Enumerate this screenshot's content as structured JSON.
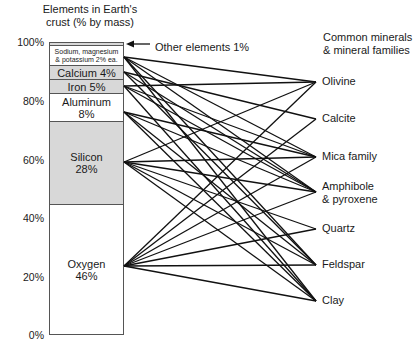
{
  "left_title": {
    "line1": "Elements in Earth's",
    "line2": "crust (% by mass)"
  },
  "right_title": {
    "line1": "Common minerals",
    "line2": "& mineral families"
  },
  "axis_ticks": [
    "100%",
    "80%",
    "60%",
    "40%",
    "20%",
    "0%"
  ],
  "callout": "Other elements 1%",
  "elements": [
    {
      "id": "other",
      "label": "",
      "percent": 1,
      "fill": "#d8d8d8"
    },
    {
      "id": "na_mg_k",
      "label1": "Sodium, magnesium",
      "label2": "& potassium 2% ea.",
      "percent": 6,
      "fill": "#ffffff"
    },
    {
      "id": "calcium",
      "label1": "Calcium 4%",
      "label2": "",
      "percent": 4,
      "fill": "#d8d8d8"
    },
    {
      "id": "iron",
      "label1": "Iron 5%",
      "label2": "",
      "percent": 5,
      "fill": "#d8d8d8"
    },
    {
      "id": "aluminum",
      "label1": "Aluminum",
      "label2": "8%",
      "percent": 8,
      "fill": "#ffffff"
    },
    {
      "id": "silicon",
      "label1": "Silicon",
      "label2": "28%",
      "percent": 28,
      "fill": "#d8d8d8"
    },
    {
      "id": "oxygen",
      "label1": "Oxygen",
      "label2": "46%",
      "percent": 46,
      "fill": "#ffffff"
    }
  ],
  "minerals": [
    {
      "id": "olivine",
      "label1": "Olivine",
      "label2": ""
    },
    {
      "id": "calcite",
      "label1": "Calcite",
      "label2": ""
    },
    {
      "id": "mica",
      "label1": "Mica family",
      "label2": ""
    },
    {
      "id": "amphibole",
      "label1": "Amphibole",
      "label2": "& pyroxene"
    },
    {
      "id": "quartz",
      "label1": "Quartz",
      "label2": ""
    },
    {
      "id": "feldspar",
      "label1": "Feldspar",
      "label2": ""
    },
    {
      "id": "clay",
      "label1": "Clay",
      "label2": ""
    }
  ],
  "connections": {
    "na_mg_k": [
      "olivine",
      "mica",
      "amphibole",
      "feldspar",
      "clay"
    ],
    "calcium": [
      "calcite",
      "amphibole",
      "feldspar"
    ],
    "iron": [
      "olivine",
      "mica",
      "amphibole",
      "clay"
    ],
    "aluminum": [
      "mica",
      "amphibole",
      "feldspar",
      "clay"
    ],
    "silicon": [
      "olivine",
      "mica",
      "amphibole",
      "quartz",
      "feldspar",
      "clay"
    ],
    "oxygen": [
      "olivine",
      "calcite",
      "mica",
      "amphibole",
      "quartz",
      "feldspar",
      "clay"
    ]
  }
}
